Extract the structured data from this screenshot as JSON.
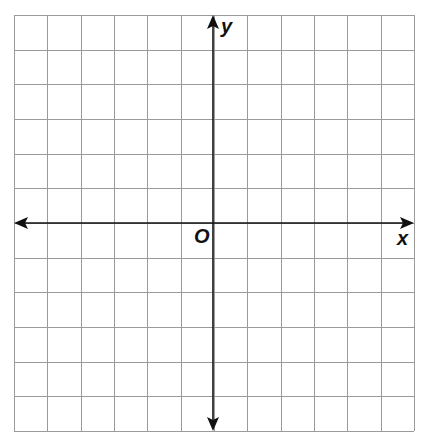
{
  "diagram": {
    "type": "coordinate-plane",
    "labels": {
      "x_axis": "x",
      "y_axis": "y",
      "origin": "O"
    },
    "grid": {
      "columns": 12,
      "rows": 12,
      "left": 14,
      "top": 15,
      "right": 414,
      "bottom": 431,
      "origin_px": [
        213,
        223
      ]
    },
    "colors": {
      "background": "#ffffff",
      "grid_line": "#9a9a9a",
      "axis": "#111111",
      "label": "#111111"
    }
  }
}
